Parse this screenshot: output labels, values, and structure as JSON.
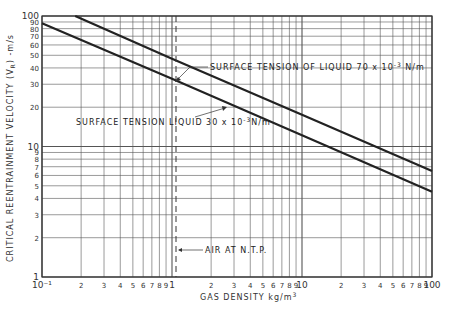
{
  "chart_data": {
    "type": "line",
    "title": "",
    "xlabel": "GAS DENSITY kg/m³",
    "ylabel": "CRITICAL REENTRAINMENT VELOCITY (V_R) -m/s",
    "xscale": "log",
    "yscale": "log",
    "xlim": [
      0.1,
      100
    ],
    "ylim": [
      1,
      100
    ],
    "grid": true,
    "x_tick_labels": [
      "10⁻¹",
      "2",
      "3",
      "4",
      "5",
      "6",
      "7",
      "8",
      "9",
      "1",
      "2",
      "3",
      "4",
      "5",
      "6",
      "7",
      "8",
      "9",
      "10",
      "2",
      "3",
      "4",
      "5",
      "6",
      "7",
      "8",
      "9",
      "100"
    ],
    "y_tick_labels": [
      "1",
      "2",
      "3",
      "4",
      "5",
      "6",
      "7",
      "8",
      "9",
      "10",
      "20",
      "30",
      "40",
      "50",
      "60",
      "70",
      "80",
      "90",
      "100"
    ],
    "series": [
      {
        "name": "SURFACE TENSION OF LIQUID 70 x 10⁻³ N/m",
        "x": [
          0.18,
          1,
          10,
          100
        ],
        "y": [
          100,
          47,
          17.5,
          6.5
        ]
      },
      {
        "name": "SURFACE TENSION LIQUID 30 x 10⁻³ N/m",
        "x": [
          0.1,
          1,
          10,
          100
        ],
        "y": [
          88,
          33,
          12.2,
          4.5
        ]
      }
    ],
    "annotations": [
      {
        "text": "SURFACE TENSION OF LIQUID 70 x 10⁻³ N/m",
        "points_to_series": 0
      },
      {
        "text": "SURFACE TENSION LIQUID 30 x 10⁻³ N/m",
        "points_to_series": 1
      },
      {
        "text": "AIR AT N.T.P.",
        "x": 1.2,
        "style": "dashed vertical line"
      }
    ]
  },
  "labels": {
    "xlabel": "GAS DENSITY kg/m",
    "xlabel_sup": "3",
    "ylabel": "CRITICAL REENTRAINMENT VELOCITY (V",
    "ylabel_sub": "R",
    "ylabel_end": ") -m/s",
    "ann70_a": "SURFACE TENSION OF LIQUID  70 x 10",
    "ann70_sup": "-3",
    "ann70_b": " N/m",
    "ann30_a": "SURFACE TENSION LIQUID 30 x 10",
    "ann30_sup": "-3",
    "ann30_b": "N/m",
    "air": "AIR AT N.T.P."
  },
  "style": {
    "line_color": "#222222",
    "grid_color": "#555555",
    "background": "#ffffff"
  }
}
